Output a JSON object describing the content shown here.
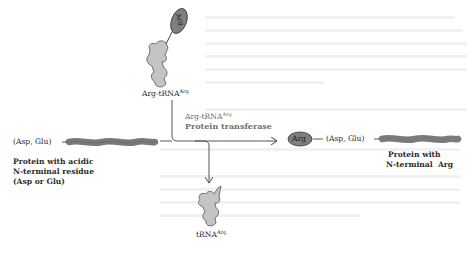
{
  "diagram": {
    "colors": {
      "background": "#ffffff",
      "protein_chain": "#7a7a7a",
      "arg_oval": "#7f7f7f",
      "trna_fill": "#c4c4c4",
      "text": "#2b2b2b",
      "enzyme_text": "#6f6f6f",
      "arrow": "#444444"
    },
    "nodes": {
      "arg_trna": {
        "oval_label": "Arg",
        "label_main": "Arg-tRNA",
        "label_sup": "Arg"
      },
      "substrate": {
        "terminal_label": "(Asp, Glu)",
        "caption_lines": [
          "Protein with acidic",
          "N-terminal residue",
          "(Asp or Glu)"
        ]
      },
      "enzyme": {
        "line1_main": "Arg-tRNA",
        "line1_sup": "Arg",
        "line2": "Protein transferase"
      },
      "product": {
        "oval_label": "Arg",
        "terminal_label": "(Asp, Glu)",
        "caption_lines": [
          "Protein with",
          "N-terminal  Arg"
        ]
      },
      "released_trna": {
        "label_main": "tRNA",
        "label_sup": "Arg"
      }
    }
  }
}
